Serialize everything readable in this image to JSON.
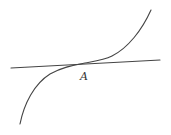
{
  "diagram": {
    "type": "cubic-curve-with-tangent-at-inflection",
    "point_label": "A",
    "colors": {
      "background": "#ffffff",
      "stroke": "#444444",
      "label": "#333333"
    },
    "tangent_line": {
      "x1": 11,
      "y1": 68,
      "x2": 160,
      "y2": 60
    },
    "curve": {
      "start": [
        20,
        124
      ],
      "inflection": [
        85,
        63
      ],
      "end": [
        151,
        10
      ]
    },
    "label_position": [
      81,
      80
    ]
  }
}
